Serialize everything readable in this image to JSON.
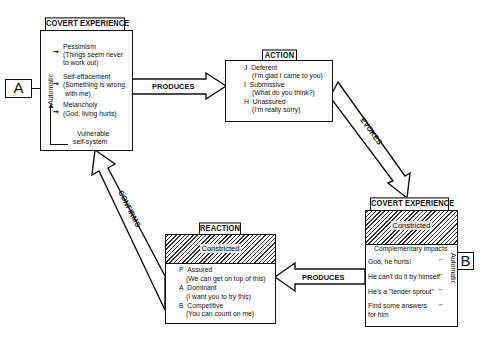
{
  "covert_experience_a": {
    "title": "COVERT EXPERIENCE",
    "marker": "A",
    "side_label": "Automatic",
    "items": [
      {
        "label": "Pessimism",
        "line2": "(Things seem never",
        "line3": "to work out)"
      },
      {
        "label": "Self-effacement",
        "line2": "(Something is wrong",
        "line3": "with me)"
      },
      {
        "label": "Melancholy",
        "line2": "(God, living hurts)"
      }
    ],
    "base": {
      "line1": "Vulnerable",
      "line2": "self-system"
    }
  },
  "action": {
    "title": "ACTION",
    "items": [
      {
        "code": "J",
        "label": "Deferent",
        "quote": "(I'm glad I came to you)"
      },
      {
        "code": "I",
        "label": "Submissive",
        "quote": "(What do you think?)"
      },
      {
        "code": "H",
        "label": "Unassured",
        "quote": "(I'm really sorry)"
      }
    ]
  },
  "covert_experience_b": {
    "title": "COVERT EXPERIENCE",
    "marker": "B",
    "hatch_label": "Constricted",
    "subtitle": "Complementary impacts",
    "side_label": "Automatic",
    "items": [
      "God, he hurts!",
      "He can't do it by himself",
      "He's a \"tender sprout\"",
      "Find some answers",
      "for him"
    ]
  },
  "reaction": {
    "title": "REACTION",
    "hatch_label": "Constricted",
    "items": [
      {
        "code": "P",
        "label": "Assured",
        "quote": "(We can get on top of this)"
      },
      {
        "code": "A",
        "label": "Dominant",
        "quote": "(I want you to try this)"
      },
      {
        "code": "B",
        "label": "Competitive",
        "quote": "(You can count on me)"
      }
    ]
  },
  "arrows": {
    "a_to_action": "PRODUCES",
    "action_to_b": "EVOKES",
    "b_to_reaction": "PRODUCES",
    "reaction_to_a": "CONFIRMS"
  }
}
